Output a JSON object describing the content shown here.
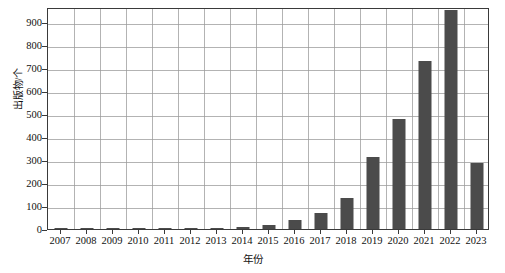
{
  "chart_data": {
    "type": "bar",
    "title": "",
    "xlabel": "年份",
    "ylabel": "出版物/个",
    "categories": [
      "2007",
      "2008",
      "2009",
      "2010",
      "2011",
      "2012",
      "2013",
      "2014",
      "2015",
      "2016",
      "2017",
      "2018",
      "2019",
      "2020",
      "2021",
      "2022",
      "2023"
    ],
    "values": [
      1,
      1,
      1,
      4,
      4,
      6,
      2,
      10,
      18,
      40,
      70,
      135,
      315,
      480,
      730,
      950,
      285
    ],
    "ylim": [
      0,
      965
    ],
    "yticks": [
      0,
      100,
      200,
      300,
      400,
      500,
      600,
      700,
      800,
      900
    ],
    "ytick_labels": [
      "0",
      "100",
      "200",
      "300",
      "400",
      "500",
      "600",
      "700",
      "800",
      "900"
    ],
    "grid": true,
    "legend": "none",
    "bar_color": "#4b4b4b",
    "grid_color": "#9a9a9a",
    "axis_color": "#3a3a3a"
  }
}
